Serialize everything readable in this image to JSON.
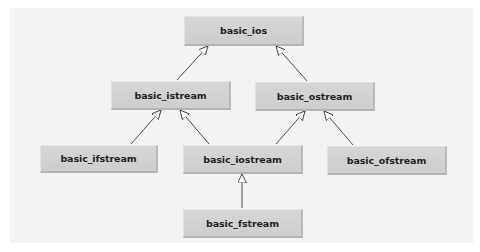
{
  "diagram": {
    "type": "class-inheritance-hierarchy",
    "nodes": [
      {
        "id": "basic_ios",
        "label": "basic_ios",
        "x": 184,
        "y": 16,
        "w": 120,
        "h": 30
      },
      {
        "id": "basic_istream",
        "label": "basic_istream",
        "x": 111,
        "y": 81,
        "w": 120,
        "h": 29
      },
      {
        "id": "basic_ostream",
        "label": "basic_ostream",
        "x": 255,
        "y": 82,
        "w": 120,
        "h": 29
      },
      {
        "id": "basic_ifstream",
        "label": "basic_ifstream",
        "x": 40,
        "y": 145,
        "w": 118,
        "h": 28
      },
      {
        "id": "basic_iostream",
        "label": "basic_iostream",
        "x": 183,
        "y": 145,
        "w": 120,
        "h": 29
      },
      {
        "id": "basic_ofstream",
        "label": "basic_ofstream",
        "x": 327,
        "y": 146,
        "w": 120,
        "h": 29
      },
      {
        "id": "basic_fstream",
        "label": "basic_fstream",
        "x": 183,
        "y": 209,
        "w": 120,
        "h": 29
      }
    ],
    "edges": [
      {
        "from": "basic_istream",
        "to": "basic_ios",
        "arrow": "hollow-triangle"
      },
      {
        "from": "basic_ostream",
        "to": "basic_ios",
        "arrow": "hollow-triangle"
      },
      {
        "from": "basic_ifstream",
        "to": "basic_istream",
        "arrow": "hollow-triangle"
      },
      {
        "from": "basic_iostream",
        "to": "basic_istream",
        "arrow": "hollow-triangle"
      },
      {
        "from": "basic_iostream",
        "to": "basic_ostream",
        "arrow": "hollow-triangle"
      },
      {
        "from": "basic_ofstream",
        "to": "basic_ostream",
        "arrow": "hollow-triangle"
      },
      {
        "from": "basic_fstream",
        "to": "basic_iostream",
        "arrow": "hollow-triangle"
      }
    ],
    "colors": {
      "panel": "#f3f3f3",
      "node_fill": "#d2d2d2",
      "edge": "#3a3a3a",
      "text": "#1e1e1e"
    }
  }
}
